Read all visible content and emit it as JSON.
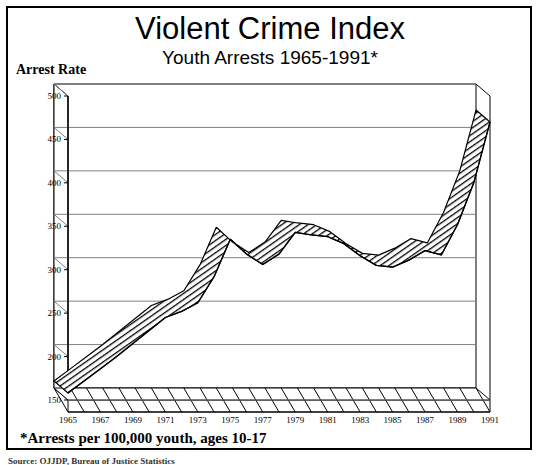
{
  "header": {
    "title": "Violent Crime Index",
    "subtitle": "Youth Arrests 1965-1991*",
    "axis_label": "Arrest Rate"
  },
  "footnote": "*Arrests per 100,000 youth, ages 10-17",
  "source_line": "Source: OJJDP, Bureau of Justice Statistics",
  "colors": {
    "ink": "#000000",
    "grid": "#808080",
    "band_fill": "#1a1a1a",
    "page": "#ffffff"
  },
  "chart_data": {
    "type": "area",
    "title": "Violent Crime Index",
    "subtitle": "Youth Arrests 1965-1991*",
    "xlabel": "",
    "ylabel": "Arrest Rate",
    "ylim": [
      150,
      500
    ],
    "yticks": [
      150,
      200,
      250,
      300,
      350,
      400,
      450,
      500
    ],
    "xlim": [
      1965,
      1991
    ],
    "xticks": [
      1965,
      1967,
      1969,
      1971,
      1973,
      1975,
      1977,
      1979,
      1981,
      1983,
      1985,
      1987,
      1989,
      1991
    ],
    "xtick_labels": [
      "1965",
      "1967",
      "1969",
      "1971",
      "1973",
      "1975",
      "1977",
      "1979",
      "1981",
      "1983",
      "1985",
      "1987",
      "1989",
      "1991"
    ],
    "grid": true,
    "legend": "none",
    "projection": "3d-ribbon",
    "note": "Single 3D ribbon band; front edge and back edge of the ribbon both plotted",
    "x": [
      1965,
      1966,
      1967,
      1968,
      1969,
      1970,
      1971,
      1972,
      1973,
      1974,
      1975,
      1976,
      1977,
      1978,
      1979,
      1980,
      1981,
      1982,
      1983,
      1984,
      1985,
      1986,
      1987,
      1988,
      1989,
      1990,
      1991
    ],
    "series": [
      {
        "name": "Violent Crime Index arrest rate (ages 10-17)",
        "values": [
          158,
          172,
          186,
          200,
          215,
          230,
          245,
          252,
          262,
          292,
          335,
          318,
          306,
          318,
          343,
          340,
          338,
          330,
          316,
          305,
          303,
          311,
          322,
          317,
          352,
          400,
          470
        ]
      }
    ]
  }
}
